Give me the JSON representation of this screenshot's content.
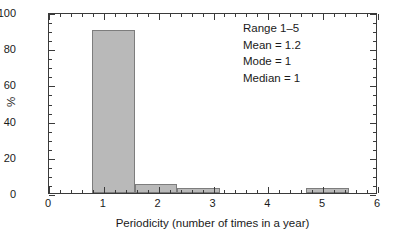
{
  "chart_data": {
    "type": "bar",
    "title": "",
    "subtitle": "",
    "xlabel": "Periodicity (number of times in a year)",
    "ylabel": "%",
    "xlim": [
      0,
      6
    ],
    "ylim": [
      0,
      100
    ],
    "grid": false,
    "legend": null,
    "bin_edges": [
      0.78,
      1.56,
      2.34,
      3.12,
      4.69,
      5.47
    ],
    "bins": [
      {
        "label": "0.8-1.6",
        "start": 0.78,
        "end": 1.56,
        "value": 90
      },
      {
        "label": "1.6-2.3",
        "start": 1.56,
        "end": 2.34,
        "value": 5
      },
      {
        "label": "2.3-3.1",
        "start": 2.34,
        "end": 3.12,
        "value": 2.5
      },
      {
        "label": "4.7-5.5",
        "start": 4.69,
        "end": 5.47,
        "value": 2.5
      }
    ],
    "categories": [
      "1",
      "2",
      "3",
      "5"
    ],
    "values": [
      90,
      5,
      2.5,
      2.5
    ],
    "x_ticks": [
      {
        "value": 0,
        "label": "0"
      },
      {
        "value": 1,
        "label": "1"
      },
      {
        "value": 2,
        "label": "2"
      },
      {
        "value": 3,
        "label": "3"
      },
      {
        "value": 4,
        "label": "4"
      },
      {
        "value": 5,
        "label": "5"
      },
      {
        "value": 6,
        "label": "6"
      }
    ],
    "x_minor_step": 0.2,
    "y_ticks": [
      {
        "value": 0,
        "label": "0"
      },
      {
        "value": 20,
        "label": "20"
      },
      {
        "value": 40,
        "label": "40"
      },
      {
        "value": 60,
        "label": "60"
      },
      {
        "value": 80,
        "label": "80"
      },
      {
        "value": 100,
        "label": "100"
      }
    ],
    "y_minor_step": 5,
    "bar_fill_color": "#b9b9b9",
    "bar_edge_color": "#7d7d7d",
    "axis_color": "#3a3a3a",
    "background_color": "#ffffff",
    "annotations": [
      "Range 1–5",
      "Mean = 1.2",
      "Mode = 1",
      "Median = 1"
    ]
  },
  "annotation": {
    "range": "Range 1–5",
    "mean": "Mean = 1.2",
    "mode": "Mode = 1",
    "median": "Median = 1"
  }
}
